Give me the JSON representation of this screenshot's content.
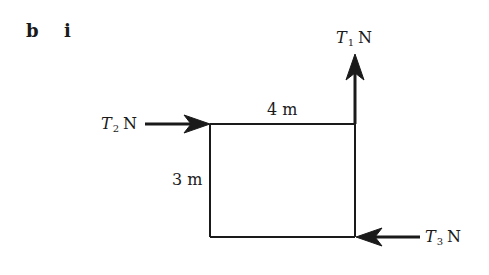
{
  "part": {
    "letter": "b",
    "numeral": "i"
  },
  "figure": {
    "shape": "rectangle",
    "width_label": "4 m",
    "height_label": "3 m",
    "dimensions": {
      "width": {
        "value": 4,
        "unit": "m"
      },
      "height": {
        "value": 3,
        "unit": "m"
      }
    },
    "forces": [
      {
        "id": "T1",
        "symbol": "T",
        "subscript": "1",
        "unit": "N",
        "direction": "up",
        "applied_at": "top-right corner"
      },
      {
        "id": "T2",
        "symbol": "T",
        "subscript": "2",
        "unit": "N",
        "direction": "right",
        "applied_at": "top-left corner"
      },
      {
        "id": "T3",
        "symbol": "T",
        "subscript": "3",
        "unit": "N",
        "direction": "left",
        "applied_at": "bottom-right corner"
      }
    ],
    "colors": {
      "line": "#1a1a1a",
      "background": "#ffffff"
    }
  }
}
